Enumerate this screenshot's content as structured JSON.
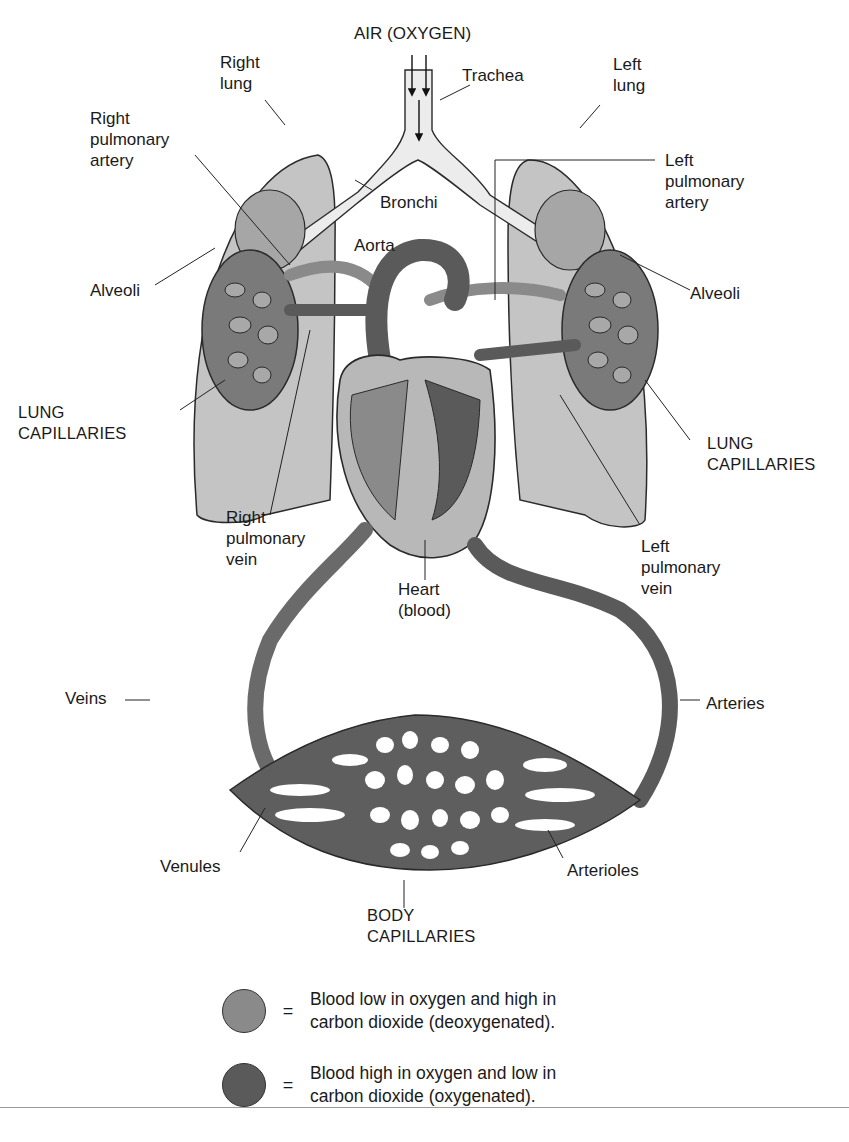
{
  "figure": {
    "title": "AIR (OXYGEN)",
    "colors": {
      "deoxygenated": "#8a8a8a",
      "oxygenated": "#5a5a5a",
      "lung_tissue": "#c4c4c4",
      "airway": "#ececec",
      "outline": "#2a2a2a",
      "background": "#ffffff"
    },
    "labels": {
      "right_lung": "Right\nlung",
      "left_lung": "Left\nlung",
      "trachea": "Trachea",
      "right_pulmonary_artery": "Right\npulmonary\nartery",
      "left_pulmonary_artery": "Left\npulmonary\nartery",
      "bronchi": "Bronchi",
      "aorta": "Aorta",
      "alveoli_left_side": "Alveoli",
      "alveoli_right_side": "Alveoli",
      "lung_capillaries_left_side": "LUNG\nCAPILLARIES",
      "lung_capillaries_right_side": "LUNG\nCAPILLARIES",
      "right_pulmonary_vein": "Right\npulmonary\nvein",
      "left_pulmonary_vein": "Left\npulmonary\nvein",
      "heart": "Heart\n(blood)",
      "veins": "Veins",
      "arteries": "Arteries",
      "venules": "Venules",
      "arterioles": "Arterioles",
      "body_capillaries": "BODY\nCAPILLARIES"
    }
  },
  "legend": [
    {
      "swatch": "deoxygenated",
      "symbol": "=",
      "text": "Blood low in oxygen and high in\ncarbon dioxide (deoxygenated)."
    },
    {
      "swatch": "oxygenated",
      "symbol": "=",
      "text": "Blood high in oxygen and low in\ncarbon dioxide (oxygenated)."
    }
  ]
}
